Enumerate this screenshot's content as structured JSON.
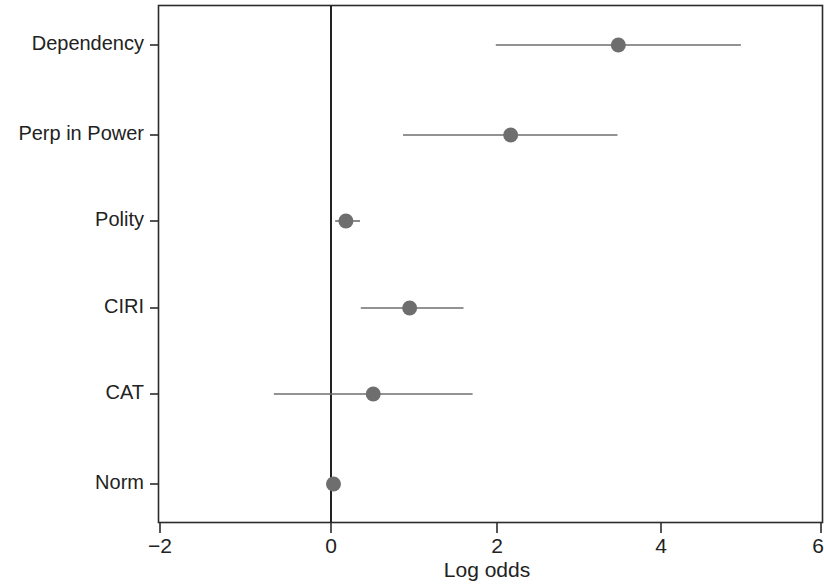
{
  "figure": {
    "background_color": "#ffffff",
    "point_color": "#6e6e6e",
    "line_color": "#6e6e6e",
    "axis_color": "#2b2b2b"
  },
  "chart_data": {
    "type": "scatter",
    "title": "",
    "subtitle": "",
    "xlabel": "Log odds",
    "ylabel": "",
    "xlim": [
      -2.15,
      6.0
    ],
    "ylim": [
      0,
      7
    ],
    "grid": false,
    "legend": "none",
    "reference_line": {
      "orientation": "vertical",
      "value": 0,
      "label": "0"
    },
    "xticks": [
      -2,
      0,
      2,
      4,
      6
    ],
    "xticklabels": [
      "−2",
      "0",
      "2",
      "4",
      "6"
    ],
    "categories": [
      "Dependency",
      "Perp in Power",
      "Polity",
      "CIRI",
      "CAT",
      "Norm"
    ],
    "values": [
      3.47,
      2.17,
      0.18,
      0.95,
      0.51,
      0.03
    ],
    "ci_low": [
      1.99,
      0.87,
      0.05,
      0.36,
      -0.69,
      0.03
    ],
    "ci_high": [
      4.95,
      3.46,
      0.35,
      1.6,
      1.71,
      0.03
    ],
    "points": [
      {
        "label": "Dependency",
        "estimate": 3.47,
        "ci_low": 1.99,
        "ci_high": 4.95
      },
      {
        "label": "Perp in Power",
        "estimate": 2.17,
        "ci_low": 0.87,
        "ci_high": 3.46
      },
      {
        "label": "Polity",
        "estimate": 0.18,
        "ci_low": 0.05,
        "ci_high": 0.35
      },
      {
        "label": "CIRI",
        "estimate": 0.95,
        "ci_low": 0.36,
        "ci_high": 1.6
      },
      {
        "label": "CAT",
        "estimate": 0.51,
        "ci_low": -0.69,
        "ci_high": 1.71
      },
      {
        "label": "Norm",
        "estimate": 0.03,
        "ci_low": 0.03,
        "ci_high": 0.03
      }
    ]
  }
}
